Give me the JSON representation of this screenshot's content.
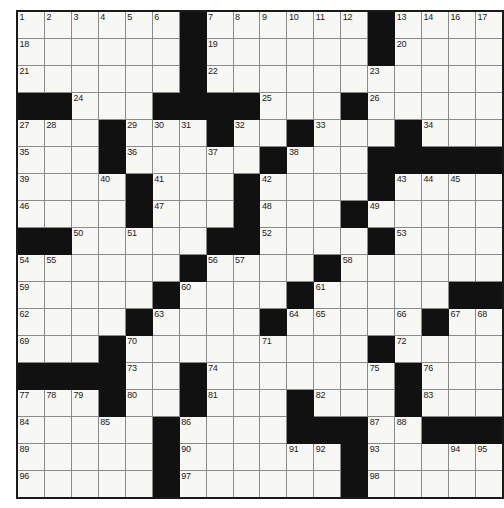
{
  "puzzle": {
    "title": "",
    "type": "crossword-grid",
    "rows": 18,
    "columns": 18,
    "cell_size_px": 26,
    "colors": {
      "block": "#111111",
      "cell": "#f7f7f4",
      "grid_line": "#8a8a8a",
      "border": "#1a1a1a",
      "number_text": "#1b1b1b",
      "page_background": "#ffffff"
    },
    "highest_clue_number": 101,
    "grid": [
      "..........#......#",
      "......#......#....",
      "......#......#....",
      "##..###......#....",
      "..#...###..##..#..",
      "...#..#...#.##....",
      "...#.##.....##...#",
      "...##.#...#..##...",
      "##...#...##...#...",
      "..#...#.##..#.....",
      "..#..#.##...#.....",
      "..#..#.#...##...##",
      "...#.#..##....#...",
      "###...#....#..#...",
      "...#.#..#..#..#...",
      "...#..#..###..#.##",
      "..#....#..#..#....",
      "..#...#..#...#...."
    ],
    "numbers": {
      "r1": [
        {
          "col": 1,
          "n": "1"
        },
        {
          "col": 2,
          "n": "2"
        },
        {
          "col": 3,
          "n": "3"
        },
        {
          "col": 4,
          "n": "4"
        },
        {
          "col": 5,
          "n": "5"
        },
        {
          "col": 6,
          "n": "6"
        },
        {
          "col": 8,
          "n": "7"
        },
        {
          "col": 9,
          "n": "8"
        },
        {
          "col": 10,
          "n": "9"
        },
        {
          "col": 11,
          "n": "10"
        },
        {
          "col": 12,
          "n": "11"
        },
        {
          "col": 13,
          "n": "12"
        },
        {
          "col": 15,
          "n": "13"
        },
        {
          "col": 16,
          "n": "14"
        },
        {
          "col": 17,
          "n": "15"
        },
        {
          "col": 18,
          "n": "16"
        }
      ],
      "all": [
        {
          "r": 1,
          "c": 1,
          "n": "1"
        },
        {
          "r": 1,
          "c": 2,
          "n": "2"
        },
        {
          "r": 1,
          "c": 3,
          "n": "3"
        },
        {
          "r": 1,
          "c": 4,
          "n": "4"
        },
        {
          "r": 1,
          "c": 5,
          "n": "5"
        },
        {
          "r": 1,
          "c": 6,
          "n": "6"
        },
        {
          "r": 1,
          "c": 8,
          "n": "7"
        },
        {
          "r": 1,
          "c": 9,
          "n": "8"
        },
        {
          "r": 1,
          "c": 10,
          "n": "9"
        },
        {
          "r": 1,
          "c": 11,
          "n": "10"
        },
        {
          "r": 1,
          "c": 12,
          "n": "11"
        },
        {
          "r": 1,
          "c": 13,
          "n": "12"
        },
        {
          "r": 1,
          "c": 15,
          "n": "13"
        },
        {
          "r": 1,
          "c": 16,
          "n": "14"
        },
        {
          "r": 1,
          "c": 17,
          "n": "15"
        },
        {
          "r": 1,
          "c": 18,
          "n": "16"
        },
        {
          "r": 1,
          "c": 18,
          "n2": "17"
        },
        {
          "r": 2,
          "c": 1,
          "n": "18"
        },
        {
          "r": 2,
          "c": 8,
          "n": "19"
        },
        {
          "r": 2,
          "c": 15,
          "n": "20"
        },
        {
          "r": 3,
          "c": 1,
          "n": "21"
        },
        {
          "r": 3,
          "c": 8,
          "n": "22"
        },
        {
          "r": 3,
          "c": 14,
          "n": "23"
        },
        {
          "r": 4,
          "c": 3,
          "n": "24"
        },
        {
          "r": 4,
          "c": 10,
          "n": "25"
        },
        {
          "r": 4,
          "c": 14,
          "n": "26"
        },
        {
          "r": 5,
          "c": 1,
          "n": "27"
        },
        {
          "r": 5,
          "c": 2,
          "n": "28"
        },
        {
          "r": 5,
          "c": 5,
          "n": "29"
        },
        {
          "r": 5,
          "c": 6,
          "n": "30"
        },
        {
          "r": 5,
          "c": 7,
          "n": "31"
        },
        {
          "r": 5,
          "c": 9,
          "n": "32"
        },
        {
          "r": 5,
          "c": 12,
          "n": "33"
        },
        {
          "r": 5,
          "c": 16,
          "n": "34"
        },
        {
          "r": 6,
          "c": 1,
          "n": "35"
        },
        {
          "r": 6,
          "c": 5,
          "n": "36"
        },
        {
          "r": 6,
          "c": 8,
          "n": "37"
        },
        {
          "r": 6,
          "c": 11,
          "n": "38"
        },
        {
          "r": 7,
          "c": 1,
          "n": "39"
        },
        {
          "r": 7,
          "c": 4,
          "n": "40"
        },
        {
          "r": 7,
          "c": 6,
          "n": "41"
        },
        {
          "r": 7,
          "c": 10,
          "n": "42"
        },
        {
          "r": 7,
          "c": 15,
          "n": "43"
        },
        {
          "r": 7,
          "c": 16,
          "n": "44"
        },
        {
          "r": 7,
          "c": 17,
          "n": "45"
        },
        {
          "r": 8,
          "c": 1,
          "n": "46"
        },
        {
          "r": 8,
          "c": 6,
          "n": "47"
        },
        {
          "r": 8,
          "c": 10,
          "n": "48"
        },
        {
          "r": 8,
          "c": 14,
          "n": "49"
        },
        {
          "r": 9,
          "c": 3,
          "n": "50"
        },
        {
          "r": 9,
          "c": 5,
          "n": "51"
        },
        {
          "r": 9,
          "c": 10,
          "n": "52"
        },
        {
          "r": 9,
          "c": 15,
          "n": "53"
        },
        {
          "r": 10,
          "c": 1,
          "n": "54"
        },
        {
          "r": 10,
          "c": 2,
          "n": "55"
        },
        {
          "r": 10,
          "c": 8,
          "n": "56"
        },
        {
          "r": 10,
          "c": 9,
          "n": "57"
        },
        {
          "r": 10,
          "c": 13,
          "n": "58"
        },
        {
          "r": 11,
          "c": 1,
          "n": "59"
        },
        {
          "r": 11,
          "c": 7,
          "n": "60"
        },
        {
          "r": 11,
          "c": 12,
          "n": "61"
        },
        {
          "r": 12,
          "c": 1,
          "n": "62"
        },
        {
          "r": 12,
          "c": 6,
          "n": "63"
        },
        {
          "r": 12,
          "c": 11,
          "n": "64"
        },
        {
          "r": 12,
          "c": 12,
          "n": "65"
        },
        {
          "r": 12,
          "c": 15,
          "n": "66"
        },
        {
          "r": 12,
          "c": 17,
          "n": "67"
        },
        {
          "r": 12,
          "c": 18,
          "n": "68"
        },
        {
          "r": 13,
          "c": 1,
          "n": "69"
        },
        {
          "r": 13,
          "c": 5,
          "n": "70"
        },
        {
          "r": 13,
          "c": 10,
          "n": "71"
        },
        {
          "r": 13,
          "c": 15,
          "n": "72"
        },
        {
          "r": 14,
          "c": 5,
          "n": "73"
        },
        {
          "r": 14,
          "c": 8,
          "n": "74"
        },
        {
          "r": 14,
          "c": 14,
          "n": "75"
        },
        {
          "r": 14,
          "c": 16,
          "n": "76"
        },
        {
          "r": 15,
          "c": 1,
          "n": "77"
        },
        {
          "r": 15,
          "c": 2,
          "n": "78"
        },
        {
          "r": 15,
          "c": 3,
          "n": "79"
        },
        {
          "r": 15,
          "c": 5,
          "n": "80"
        },
        {
          "r": 15,
          "c": 8,
          "n": "81"
        },
        {
          "r": 15,
          "c": 12,
          "n": "82"
        },
        {
          "r": 15,
          "c": 16,
          "n": "83"
        },
        {
          "r": 16,
          "c": 1,
          "n": "84"
        },
        {
          "r": 16,
          "c": 4,
          "n": "85"
        },
        {
          "r": 16,
          "c": 7,
          "n": "86"
        },
        {
          "r": 16,
          "c": 14,
          "n": "87"
        },
        {
          "r": 16,
          "c": 15,
          "n": "88"
        },
        {
          "r": 17,
          "c": 1,
          "n": "89"
        },
        {
          "r": 17,
          "c": 7,
          "n": "90"
        },
        {
          "r": 17,
          "c": 11,
          "n": "91"
        },
        {
          "r": 17,
          "c": 12,
          "n": "92"
        },
        {
          "r": 17,
          "c": 14,
          "n": "93"
        },
        {
          "r": 17,
          "c": 17,
          "n": "94"
        },
        {
          "r": 17,
          "c": 18,
          "n": "95"
        },
        {
          "r": 18,
          "c": 1,
          "n": "96"
        },
        {
          "r": 18,
          "c": 7,
          "n": "97"
        },
        {
          "r": 18,
          "c": 14,
          "n": "98"
        },
        {
          "r": 19,
          "c": 1,
          "n": "99"
        },
        {
          "r": 19,
          "c": 7,
          "n": "100"
        },
        {
          "r": 19,
          "c": 14,
          "n": "101"
        }
      ]
    },
    "layout": {
      "blocks": [
        {
          "r": 1,
          "c": 7
        },
        {
          "r": 1,
          "c": 14
        },
        {
          "r": 2,
          "c": 7
        },
        {
          "r": 2,
          "c": 14
        },
        {
          "r": 3,
          "c": 7
        },
        {
          "r": 4,
          "c": 1
        },
        {
          "r": 4,
          "c": 2
        },
        {
          "r": 4,
          "c": 6
        },
        {
          "r": 4,
          "c": 7
        },
        {
          "r": 4,
          "c": 8
        },
        {
          "r": 4,
          "c": 9
        },
        {
          "r": 4,
          "c": 13
        },
        {
          "r": 5,
          "c": 4
        },
        {
          "r": 5,
          "c": 8
        },
        {
          "r": 5,
          "c": 11
        },
        {
          "r": 5,
          "c": 15
        },
        {
          "r": 6,
          "c": 4
        },
        {
          "r": 6,
          "c": 10
        },
        {
          "r": 6,
          "c": 14
        },
        {
          "r": 6,
          "c": 15
        },
        {
          "r": 6,
          "c": 16
        },
        {
          "r": 6,
          "c": 17
        },
        {
          "r": 6,
          "c": 18
        },
        {
          "r": 7,
          "c": 5
        },
        {
          "r": 7,
          "c": 9
        },
        {
          "r": 7,
          "c": 14
        },
        {
          "r": 8,
          "c": 5
        },
        {
          "r": 8,
          "c": 9
        },
        {
          "r": 8,
          "c": 13
        },
        {
          "r": 9,
          "c": 1
        },
        {
          "r": 9,
          "c": 2
        },
        {
          "r": 9,
          "c": 8
        },
        {
          "r": 9,
          "c": 9
        },
        {
          "r": 9,
          "c": 14
        },
        {
          "r": 10,
          "c": 7
        },
        {
          "r": 10,
          "c": 12
        },
        {
          "r": 11,
          "c": 6
        },
        {
          "r": 11,
          "c": 11
        },
        {
          "r": 11,
          "c": 17
        },
        {
          "r": 11,
          "c": 18
        },
        {
          "r": 12,
          "c": 5
        },
        {
          "r": 12,
          "c": 10
        },
        {
          "r": 12,
          "c": 16
        },
        {
          "r": 13,
          "c": 4
        },
        {
          "r": 13,
          "c": 14
        },
        {
          "r": 14,
          "c": 1
        },
        {
          "r": 14,
          "c": 2
        },
        {
          "r": 14,
          "c": 3
        },
        {
          "r": 14,
          "c": 4
        },
        {
          "r": 14,
          "c": 7
        },
        {
          "r": 14,
          "c": 15
        },
        {
          "r": 15,
          "c": 4
        },
        {
          "r": 15,
          "c": 7
        },
        {
          "r": 15,
          "c": 11
        },
        {
          "r": 15,
          "c": 15
        },
        {
          "r": 16,
          "c": 6
        },
        {
          "r": 16,
          "c": 11
        },
        {
          "r": 16,
          "c": 12
        },
        {
          "r": 16,
          "c": 13
        },
        {
          "r": 16,
          "c": 16
        },
        {
          "r": 16,
          "c": 17
        },
        {
          "r": 16,
          "c": 18
        },
        {
          "r": 17,
          "c": 6
        },
        {
          "r": 17,
          "c": 13
        },
        {
          "r": 18,
          "c": 6
        },
        {
          "r": 18,
          "c": 13
        }
      ]
    }
  }
}
